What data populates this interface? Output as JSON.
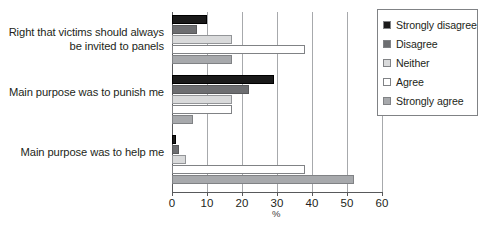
{
  "chart_data": {
    "type": "bar",
    "orientation": "horizontal",
    "title": "",
    "xlabel": "%",
    "ylabel": "",
    "xlim": [
      0,
      60
    ],
    "xticks": [
      0,
      10,
      20,
      30,
      40,
      50,
      60
    ],
    "grid": true,
    "legend_position": "right",
    "categories": [
      "Right that victims should always be invited to panels",
      "Main purpose was to punish me",
      "Main purpose was to help me"
    ],
    "series": [
      {
        "name": "Strongly disagree",
        "color": "#1a1a1a",
        "values": [
          10,
          29,
          1
        ]
      },
      {
        "name": "Disagree",
        "color": "#6d6e71",
        "values": [
          7,
          22,
          2
        ]
      },
      {
        "name": "Neither",
        "color": "#d9dadb",
        "values": [
          17,
          17,
          4
        ]
      },
      {
        "name": "Agree",
        "color": "#ffffff",
        "values": [
          38,
          17,
          38
        ]
      },
      {
        "name": "Strongly agree",
        "color": "#a7a9ac",
        "values": [
          17,
          6,
          52
        ]
      }
    ]
  },
  "category_lines": [
    [
      "Right that victims should always",
      "be invited to panels"
    ],
    [
      "Main purpose was to punish me"
    ],
    [
      "Main purpose was to help me"
    ]
  ]
}
